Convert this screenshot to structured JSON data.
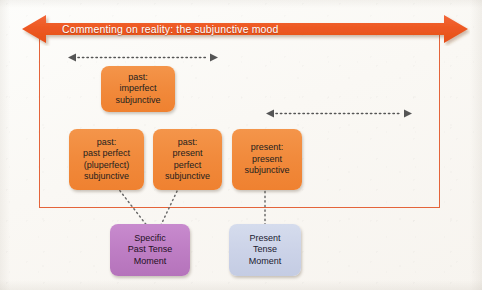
{
  "figure": {
    "banner": {
      "label": "Commenting on reality: the subjunctive mood",
      "color": "#ee5a24",
      "text_color": "#ffffff",
      "style": "double-headed-arrow"
    },
    "frame": {
      "border_color": "#e4643a"
    },
    "background_color": "#fbfaf7",
    "span_arrows": [
      {
        "name": "past-span-arrow",
        "style": "dotted-double-headed",
        "color": "#555555",
        "covers": "past region"
      },
      {
        "name": "present-span-arrow",
        "style": "dotted-double-headed",
        "color": "#555555",
        "covers": "present region"
      }
    ],
    "nodes": [
      {
        "id": "past-imperfect-subjunctive",
        "color": "#f18a3c",
        "lines": [
          "past:",
          "imperfect",
          "subjunctive"
        ]
      },
      {
        "id": "past-past-perfect-subjunctive",
        "color": "#f18a3c",
        "lines": [
          "past:",
          "past perfect",
          "(pluperfect)",
          "subjunctive"
        ]
      },
      {
        "id": "past-present-perfect-subjunctive",
        "color": "#f18a3c",
        "lines": [
          "past:",
          "present",
          "perfect",
          "subjunctive"
        ]
      },
      {
        "id": "present-present-subjunctive",
        "color": "#f18a3c",
        "lines": [
          "present:",
          "present",
          "subjunctive"
        ]
      },
      {
        "id": "specific-past-tense-moment",
        "color": "#be7ec4",
        "lines": [
          "Specific",
          "Past Tense",
          "Moment"
        ]
      },
      {
        "id": "present-tense-moment",
        "color": "#ccd3e8",
        "lines": [
          "Present",
          "Tense",
          "Moment"
        ]
      }
    ],
    "connectors": [
      {
        "from": "past-past-perfect-subjunctive",
        "to": "specific-past-tense-moment",
        "style": "dotted"
      },
      {
        "from": "past-present-perfect-subjunctive",
        "to": "specific-past-tense-moment",
        "style": "dotted"
      },
      {
        "from": "present-present-subjunctive",
        "to": "present-tense-moment",
        "style": "dotted"
      }
    ]
  }
}
